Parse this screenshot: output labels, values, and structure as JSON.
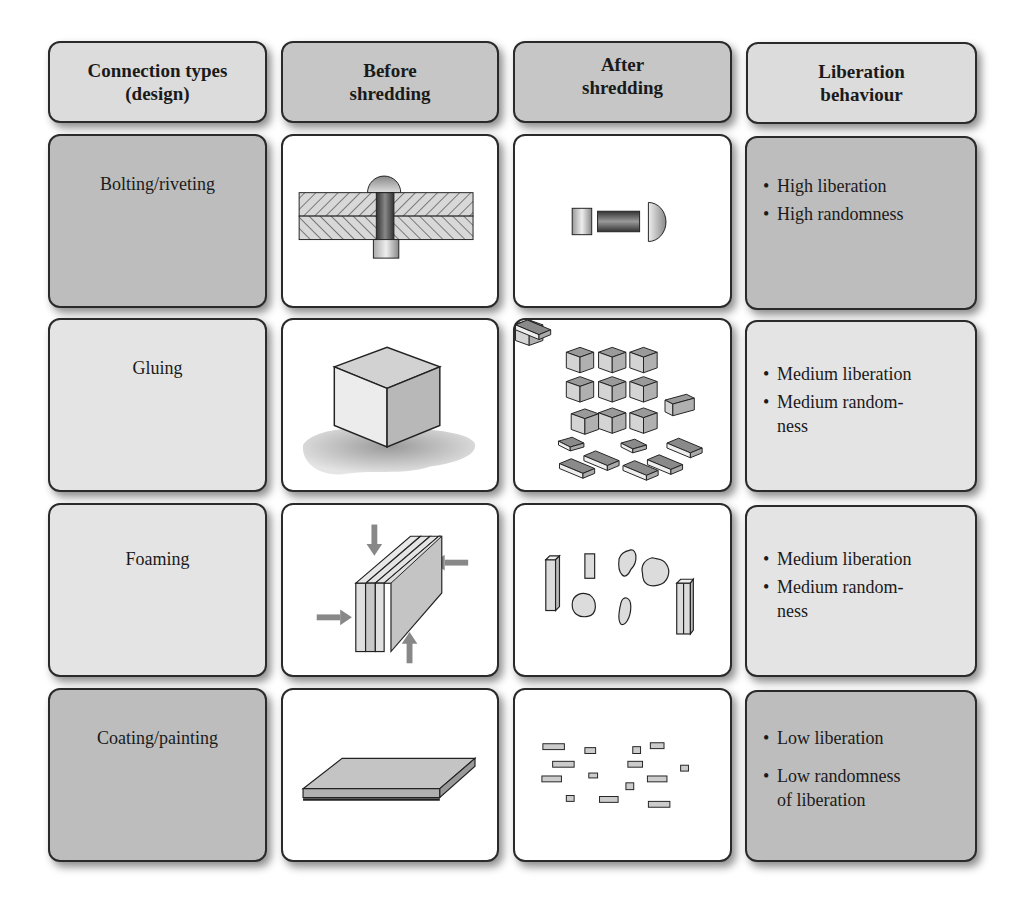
{
  "headers": [
    {
      "line1": "Connection types",
      "line2": "(design)"
    },
    {
      "line1": "Before",
      "line2": "shredding"
    },
    {
      "line1": "After",
      "line2": "shredding"
    },
    {
      "line1": "Liberation",
      "line2": "behaviour"
    }
  ],
  "rows": [
    {
      "connection_type": "Bolting/riveting",
      "before_icon": "rivet-joint-cross-section-icon",
      "after_icon": "separated-rivet-parts-icon",
      "behaviour": [
        "High liberation",
        "High randomness"
      ]
    },
    {
      "connection_type": "Gluing",
      "before_icon": "glued-cube-icon",
      "after_icon": "small-cubes-fragments-icon",
      "behaviour": [
        "Medium liberation",
        "Medium random-",
        "ness"
      ]
    },
    {
      "connection_type": "Foaming",
      "before_icon": "foamed-layered-panel-icon",
      "after_icon": "irregular-fragments-icon",
      "behaviour": [
        "Medium liberation",
        "Medium random-",
        "ness"
      ]
    },
    {
      "connection_type": "Coating/painting",
      "before_icon": "coated-plate-icon",
      "after_icon": "fine-particles-icon",
      "behaviour": [
        "Low liberation",
        "Low randomness",
        "of liberation"
      ]
    }
  ],
  "colors": {
    "dark_cell": "#bdbdbd",
    "light_cell": "#e4e4e4",
    "header_light": "#dcdcdc",
    "header_dark": "#c6c6c6",
    "border": "#2a2a2a"
  }
}
